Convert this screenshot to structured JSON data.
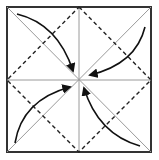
{
  "diagram": {
    "colors": {
      "border": "#333333",
      "crease": "#999999",
      "valley_fold": "#222222",
      "arrow": "#111111",
      "background": "#ffffff"
    },
    "square": {
      "x": 7,
      "y": 7,
      "size": 145
    },
    "arrows": [
      {
        "name": "arrow-top-left",
        "path": "M17 14 Q58 24 73 71"
      },
      {
        "name": "arrow-top-right",
        "path": "M145 27 Q136 64 90 75"
      },
      {
        "name": "arrow-bottom-left",
        "path": "M15 143 Q22 100 70 87"
      },
      {
        "name": "arrow-bottom-right",
        "path": "M140 146 Q98 134 84 88"
      }
    ]
  }
}
